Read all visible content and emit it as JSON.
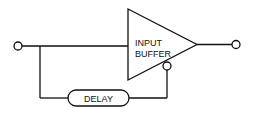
{
  "diagram": {
    "type": "block-diagram",
    "blocks": {
      "buffer": {
        "line1": "INPUT",
        "line2": "BUFFER",
        "shape": "triangle"
      },
      "delay": {
        "label": "DELAY",
        "shape": "rounded-pill"
      }
    },
    "terminals": [
      "input",
      "output",
      "buffer-control"
    ],
    "colors": {
      "stroke": "#111111",
      "background": "#ffffff"
    }
  }
}
